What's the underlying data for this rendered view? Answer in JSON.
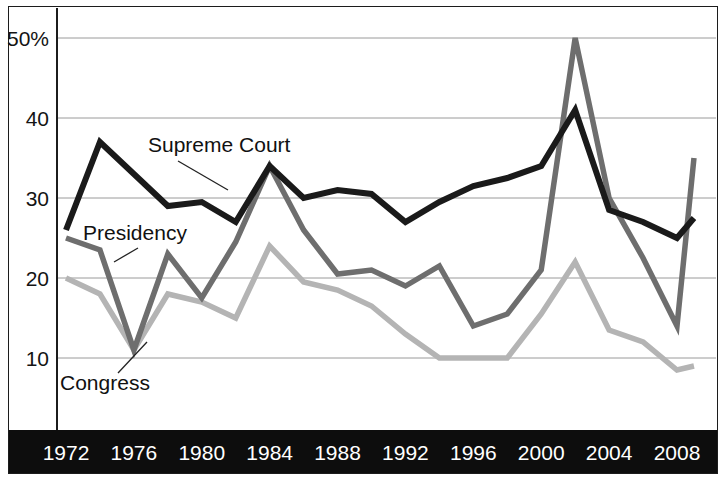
{
  "chart_data": {
    "type": "line",
    "title": "",
    "xlabel": "",
    "ylabel": "",
    "ylim": [
      5,
      52
    ],
    "yticks": [
      10,
      20,
      30,
      40,
      50
    ],
    "ytick_labels": [
      "10",
      "20",
      "30",
      "40",
      "50%"
    ],
    "xlim": [
      1972,
      2009
    ],
    "xticks": [
      1972,
      1976,
      1980,
      1984,
      1988,
      1992,
      1996,
      2000,
      2004,
      2008
    ],
    "xtick_labels": [
      "1972",
      "1976",
      "1980",
      "1984",
      "1988",
      "1992",
      "1996",
      "2000",
      "2004",
      "2008"
    ],
    "grid": "horizontal",
    "legend_position": "inline-annotations",
    "x": [
      1972,
      1974,
      1976,
      1978,
      1980,
      1982,
      1984,
      1986,
      1988,
      1990,
      1992,
      1994,
      1996,
      1998,
      2000,
      2002,
      2004,
      2006,
      2008,
      2009
    ],
    "series": [
      {
        "name": "Supreme Court",
        "color": "#1a1a1a",
        "values": [
          26,
          37,
          33,
          29,
          29.5,
          27,
          34,
          30,
          31,
          30.5,
          27,
          29.5,
          31.5,
          32.5,
          34,
          41,
          28.5,
          27,
          25,
          27.5
        ]
      },
      {
        "name": "Presidency",
        "color": "#6e6e6e",
        "values": [
          25,
          23.5,
          11,
          23,
          17.5,
          24.5,
          34,
          26,
          20.5,
          21,
          19,
          21.5,
          14,
          15.5,
          21,
          50,
          30,
          22.5,
          14,
          35
        ]
      },
      {
        "name": "Congress",
        "color": "#b4b4b4",
        "values": [
          20,
          18,
          11,
          18,
          17,
          15,
          24,
          19.5,
          18.5,
          16.5,
          13,
          10,
          10,
          10,
          15.5,
          22,
          13.5,
          12,
          8.5,
          9
        ]
      }
    ],
    "annotations": [
      {
        "label": "Supreme Court",
        "series": "Supreme Court"
      },
      {
        "label": "Presidency",
        "series": "Presidency"
      },
      {
        "label": "Congress",
        "series": "Congress"
      }
    ]
  },
  "colors": {
    "supreme_court": "#1a1a1a",
    "presidency": "#6e6e6e",
    "congress": "#b4b4b4",
    "gridline": "#9a9a9a",
    "axis": "#1c1c1c",
    "xaxis_band": "#0d0d0d",
    "xaxis_band_text": "#ffffff",
    "background": "#ffffff"
  }
}
